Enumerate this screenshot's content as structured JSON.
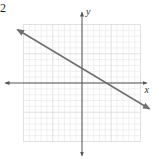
{
  "problem_number": "2",
  "chart_data": {
    "type": "line",
    "title": "",
    "xlabel": "x",
    "ylabel": "y",
    "xlim": [
      -10,
      10
    ],
    "ylim": [
      -10,
      10
    ],
    "grid": true,
    "grid_step": 1,
    "series": [
      {
        "name": "line",
        "equation": "y = -0.6x + 2.5",
        "slope": -0.6,
        "intercept": 2.5,
        "x": [
          -11,
          11.5
        ],
        "y": [
          9.1,
          -4.4
        ],
        "arrows": "both"
      }
    ],
    "intercepts": {
      "y_intercept": 2.5,
      "x_intercept": 4.2
    }
  },
  "colors": {
    "line": "#707070",
    "axes": "#555555",
    "grid_minor": "#e6e6e6",
    "grid_major": "#cfcfcf"
  },
  "layout": {
    "origin_px": [
      82,
      83
    ],
    "unit_px": 5.85,
    "grid_extent_units": 10
  }
}
